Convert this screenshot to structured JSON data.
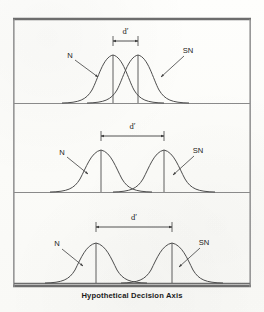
{
  "figure": {
    "caption": "Hypothetical Decision Axis",
    "axis_label": "Hypothetical Decision Axis",
    "colors": {
      "curve": "#4a4a4a",
      "frame_dark": "#6b6b6b",
      "frame_light": "#9a9a9a",
      "baseline": "#7a7a7a",
      "text": "#1b1b1b",
      "paper": "#fdfdfb"
    },
    "frame": {
      "x": 13,
      "y": 18,
      "width": 238,
      "height": 269
    },
    "panels": [
      {
        "id": "panel-top",
        "index": 1,
        "noise_label": "N",
        "signal_label": "SN",
        "separation_label": "d'",
        "separation_value": 1,
        "baseline_y": 103,
        "top_y": 19,
        "peak_y": 55,
        "noise_peak_x": 113,
        "signal_peak_x": 138,
        "sigma": 17,
        "dprime_arrow_y": 41,
        "dprime_text_x": 125.5,
        "dprime_text_y": 33,
        "noise_label_x": 70,
        "noise_label_y": 57,
        "noise_arrow": {
          "x1": 77,
          "y1": 60,
          "x2": 98,
          "y2": 76
        },
        "signal_label_x": 187,
        "signal_label_y": 52,
        "signal_arrow": {
          "x1": 184,
          "y1": 56,
          "x2": 162,
          "y2": 76
        }
      },
      {
        "id": "panel-middle",
        "index": 2,
        "noise_label": "N",
        "signal_label": "SN",
        "separation_label": "d'",
        "separation_value": 2,
        "baseline_y": 192,
        "top_y": 104,
        "peak_y": 150,
        "noise_peak_x": 101,
        "signal_peak_x": 164,
        "sigma": 17,
        "dprime_arrow_y": 136,
        "dprime_text_x": 132.5,
        "dprime_text_y": 128,
        "noise_label_x": 62,
        "noise_label_y": 154,
        "noise_arrow": {
          "x1": 69,
          "y1": 157,
          "x2": 88,
          "y2": 173
        },
        "signal_label_x": 197,
        "signal_label_y": 152,
        "signal_arrow": {
          "x1": 195,
          "y1": 156,
          "x2": 174,
          "y2": 174
        }
      },
      {
        "id": "panel-bottom",
        "index": 3,
        "noise_label": "N",
        "signal_label": "SN",
        "separation_label": "d'",
        "separation_value": 3,
        "baseline_y": 283,
        "top_y": 193,
        "peak_y": 243,
        "noise_peak_x": 96,
        "signal_peak_x": 172,
        "sigma": 17,
        "dprime_arrow_y": 227,
        "dprime_text_x": 134,
        "dprime_text_y": 219,
        "noise_label_x": 57,
        "noise_label_y": 245,
        "noise_arrow": {
          "x1": 64,
          "y1": 249,
          "x2": 83,
          "y2": 265
        },
        "signal_label_x": 202,
        "signal_label_y": 244,
        "signal_arrow": {
          "x1": 200,
          "y1": 248,
          "x2": 180,
          "y2": 266
        }
      }
    ]
  }
}
